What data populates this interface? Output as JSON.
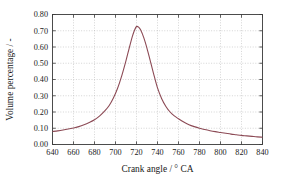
{
  "figure": {
    "background_color": "#ffffff",
    "frame_color": "#3a3a3a",
    "grid_color": "#b9b9b9"
  },
  "chart_data": {
    "type": "line",
    "title": "",
    "subtitle": "",
    "xlabel": "Crank angle / ° CA",
    "ylabel": "Volume percentage / -",
    "xlim": [
      640,
      840
    ],
    "ylim": [
      0.0,
      0.8
    ],
    "xticks": [
      640,
      660,
      680,
      700,
      720,
      740,
      760,
      780,
      800,
      820,
      840
    ],
    "yticks": [
      0.0,
      0.1,
      0.2,
      0.3,
      0.4,
      0.5,
      0.6,
      0.7,
      0.8
    ],
    "xtick_labels": [
      "640",
      "660",
      "680",
      "700",
      "720",
      "740",
      "760",
      "780",
      "800",
      "820",
      "840"
    ],
    "ytick_labels": [
      "0.00",
      "0.10",
      "0.20",
      "0.30",
      "0.40",
      "0.50",
      "0.60",
      "0.70",
      "0.80"
    ],
    "grid": true,
    "grid_style": "dotted",
    "legend": false,
    "legend_position": "none",
    "series": [
      {
        "name": "Volume percentage",
        "color": "#8c4a55",
        "line_width": 1.1,
        "x": [
          640,
          645,
          650,
          655,
          660,
          665,
          670,
          675,
          680,
          685,
          690,
          694,
          698,
          702,
          706,
          710,
          713,
          716,
          718,
          720,
          722,
          724,
          727,
          730,
          733,
          736,
          740,
          744,
          748,
          752,
          756,
          760,
          765,
          770,
          775,
          780,
          785,
          790,
          795,
          800,
          805,
          810,
          815,
          820,
          825,
          830,
          835,
          840
        ],
        "y": [
          0.08,
          0.084,
          0.089,
          0.095,
          0.102,
          0.11,
          0.121,
          0.135,
          0.152,
          0.176,
          0.208,
          0.24,
          0.286,
          0.346,
          0.424,
          0.516,
          0.592,
          0.664,
          0.702,
          0.726,
          0.722,
          0.704,
          0.656,
          0.592,
          0.518,
          0.442,
          0.348,
          0.282,
          0.234,
          0.2,
          0.176,
          0.158,
          0.138,
          0.122,
          0.11,
          0.1,
          0.092,
          0.085,
          0.079,
          0.074,
          0.069,
          0.064,
          0.06,
          0.056,
          0.053,
          0.05,
          0.047,
          0.045
        ]
      }
    ]
  }
}
